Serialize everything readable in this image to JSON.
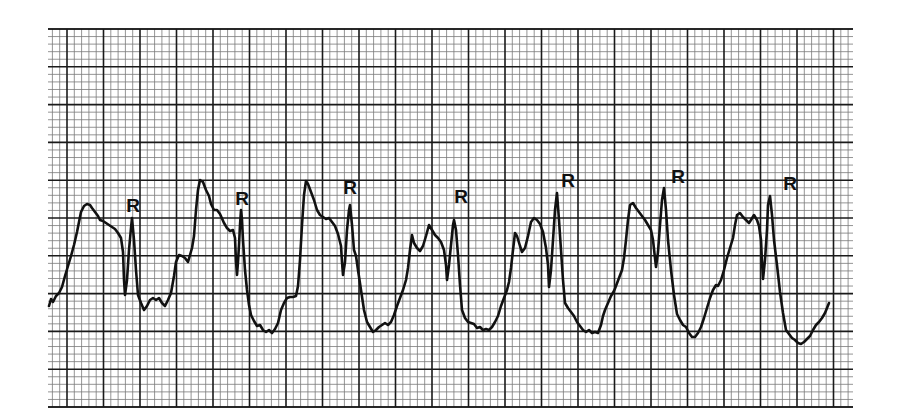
{
  "chart_data": {
    "type": "line",
    "title": "",
    "xlabel": "",
    "ylabel": "",
    "grid": {
      "on": true,
      "left": 48,
      "top": 29,
      "right": 853,
      "bottom": 407,
      "minor_spacing_x": 7.3,
      "minor_spacing_y": 7.56,
      "major_every": 5,
      "major_x_start": 67,
      "major_color": "#1a1a1a",
      "minor_color": "#7a7a7a"
    },
    "trace_color": "#111111",
    "annotations": [
      {
        "text": "R",
        "x": 133,
        "y": 212
      },
      {
        "text": "R",
        "x": 242,
        "y": 205
      },
      {
        "text": "R",
        "x": 350,
        "y": 194
      },
      {
        "text": "R",
        "x": 461,
        "y": 203
      },
      {
        "text": "R",
        "x": 568,
        "y": 187
      },
      {
        "text": "R",
        "x": 678,
        "y": 183
      },
      {
        "text": "R",
        "x": 790,
        "y": 190
      }
    ],
    "series": [
      {
        "name": "ECG trace",
        "points": [
          [
            49,
            306
          ],
          [
            51,
            299
          ],
          [
            53,
            302
          ],
          [
            56,
            296
          ],
          [
            59,
            293
          ],
          [
            62,
            287
          ],
          [
            65,
            276
          ],
          [
            68,
            266
          ],
          [
            71,
            256
          ],
          [
            74,
            245
          ],
          [
            77,
            232
          ],
          [
            79,
            222
          ],
          [
            81,
            212
          ],
          [
            84,
            206
          ],
          [
            87,
            204
          ],
          [
            90,
            205
          ],
          [
            92,
            208
          ],
          [
            95,
            212
          ],
          [
            98,
            216
          ],
          [
            100,
            220
          ],
          [
            103,
            221
          ],
          [
            106,
            223
          ],
          [
            109,
            225
          ],
          [
            112,
            227
          ],
          [
            115,
            229
          ],
          [
            118,
            233
          ],
          [
            121,
            238
          ],
          [
            123,
            252
          ],
          [
            124,
            280
          ],
          [
            125,
            295
          ],
          [
            127,
            280
          ],
          [
            129,
            250
          ],
          [
            131,
            228
          ],
          [
            132,
            218
          ],
          [
            134,
            240
          ],
          [
            136,
            270
          ],
          [
            138,
            295
          ],
          [
            141,
            303
          ],
          [
            144,
            310
          ],
          [
            147,
            306
          ],
          [
            150,
            300
          ],
          [
            153,
            298
          ],
          [
            156,
            300
          ],
          [
            159,
            298
          ],
          [
            162,
            303
          ],
          [
            165,
            306
          ],
          [
            168,
            300
          ],
          [
            171,
            293
          ],
          [
            174,
            276
          ],
          [
            176,
            262
          ],
          [
            179,
            255
          ],
          [
            182,
            256
          ],
          [
            185,
            258
          ],
          [
            188,
            262
          ],
          [
            190,
            255
          ],
          [
            192,
            248
          ],
          [
            194,
            236
          ],
          [
            196,
            210
          ],
          [
            198,
            190
          ],
          [
            200,
            180
          ],
          [
            203,
            182
          ],
          [
            206,
            190
          ],
          [
            209,
            196
          ],
          [
            211,
            204
          ],
          [
            214,
            210
          ],
          [
            217,
            210
          ],
          [
            220,
            214
          ],
          [
            224,
            223
          ],
          [
            227,
            228
          ],
          [
            230,
            231
          ],
          [
            233,
            230
          ],
          [
            235,
            238
          ],
          [
            236,
            262
          ],
          [
            237,
            275
          ],
          [
            238,
            262
          ],
          [
            239,
            245
          ],
          [
            240,
            225
          ],
          [
            241,
            210
          ],
          [
            242,
            220
          ],
          [
            243,
            240
          ],
          [
            245,
            270
          ],
          [
            247,
            290
          ],
          [
            249,
            305
          ],
          [
            251,
            315
          ],
          [
            254,
            321
          ],
          [
            257,
            326
          ],
          [
            260,
            325
          ],
          [
            263,
            330
          ],
          [
            266,
            332
          ],
          [
            269,
            330
          ],
          [
            272,
            333
          ],
          [
            275,
            329
          ],
          [
            278,
            323
          ],
          [
            281,
            310
          ],
          [
            284,
            303
          ],
          [
            287,
            298
          ],
          [
            290,
            297
          ],
          [
            293,
            297
          ],
          [
            296,
            296
          ],
          [
            298,
            286
          ],
          [
            300,
            260
          ],
          [
            302,
            225
          ],
          [
            304,
            195
          ],
          [
            306,
            181
          ],
          [
            308,
            184
          ],
          [
            311,
            192
          ],
          [
            314,
            200
          ],
          [
            317,
            210
          ],
          [
            320,
            215
          ],
          [
            323,
            217
          ],
          [
            326,
            219
          ],
          [
            329,
            218
          ],
          [
            332,
            222
          ],
          [
            335,
            226
          ],
          [
            338,
            234
          ],
          [
            341,
            246
          ],
          [
            342,
            262
          ],
          [
            343,
            275
          ],
          [
            345,
            262
          ],
          [
            347,
            230
          ],
          [
            349,
            210
          ],
          [
            350,
            205
          ],
          [
            352,
            225
          ],
          [
            354,
            250
          ],
          [
            356,
            256
          ],
          [
            358,
            270
          ],
          [
            361,
            290
          ],
          [
            364,
            310
          ],
          [
            367,
            322
          ],
          [
            370,
            327
          ],
          [
            373,
            332
          ],
          [
            376,
            330
          ],
          [
            379,
            327
          ],
          [
            382,
            325
          ],
          [
            385,
            323
          ],
          [
            388,
            325
          ],
          [
            391,
            322
          ],
          [
            394,
            315
          ],
          [
            397,
            306
          ],
          [
            400,
            298
          ],
          [
            403,
            290
          ],
          [
            406,
            280
          ],
          [
            408,
            268
          ],
          [
            410,
            250
          ],
          [
            412,
            235
          ],
          [
            414,
            243
          ],
          [
            417,
            248
          ],
          [
            420,
            251
          ],
          [
            423,
            246
          ],
          [
            426,
            236
          ],
          [
            429,
            225
          ],
          [
            432,
            230
          ],
          [
            435,
            235
          ],
          [
            438,
            238
          ],
          [
            441,
            242
          ],
          [
            444,
            250
          ],
          [
            446,
            265
          ],
          [
            447,
            280
          ],
          [
            449,
            265
          ],
          [
            451,
            245
          ],
          [
            453,
            225
          ],
          [
            454,
            220
          ],
          [
            456,
            230
          ],
          [
            458,
            255
          ],
          [
            460,
            285
          ],
          [
            462,
            310
          ],
          [
            465,
            318
          ],
          [
            468,
            322
          ],
          [
            471,
            323
          ],
          [
            474,
            324
          ],
          [
            477,
            328
          ],
          [
            480,
            327
          ],
          [
            483,
            330
          ],
          [
            486,
            329
          ],
          [
            489,
            330
          ],
          [
            492,
            327
          ],
          [
            495,
            322
          ],
          [
            498,
            316
          ],
          [
            501,
            306
          ],
          [
            504,
            298
          ],
          [
            507,
            290
          ],
          [
            509,
            282
          ],
          [
            511,
            268
          ],
          [
            513,
            250
          ],
          [
            515,
            233
          ],
          [
            517,
            236
          ],
          [
            520,
            246
          ],
          [
            522,
            252
          ],
          [
            525,
            248
          ],
          [
            528,
            236
          ],
          [
            531,
            222
          ],
          [
            534,
            218
          ],
          [
            537,
            220
          ],
          [
            540,
            224
          ],
          [
            543,
            232
          ],
          [
            546,
            248
          ],
          [
            548,
            265
          ],
          [
            549,
            287
          ],
          [
            551,
            270
          ],
          [
            553,
            240
          ],
          [
            555,
            210
          ],
          [
            557,
            193
          ],
          [
            559,
            220
          ],
          [
            561,
            250
          ],
          [
            563,
            280
          ],
          [
            565,
            303
          ],
          [
            568,
            308
          ],
          [
            571,
            312
          ],
          [
            574,
            316
          ],
          [
            577,
            322
          ],
          [
            580,
            326
          ],
          [
            583,
            330
          ],
          [
            586,
            332
          ],
          [
            589,
            330
          ],
          [
            592,
            333
          ],
          [
            595,
            332
          ],
          [
            598,
            333
          ],
          [
            601,
            325
          ],
          [
            603,
            316
          ],
          [
            605,
            310
          ],
          [
            608,
            303
          ],
          [
            611,
            296
          ],
          [
            614,
            291
          ],
          [
            616,
            286
          ],
          [
            619,
            278
          ],
          [
            622,
            270
          ],
          [
            624,
            258
          ],
          [
            626,
            240
          ],
          [
            628,
            220
          ],
          [
            630,
            205
          ],
          [
            633,
            203
          ],
          [
            636,
            208
          ],
          [
            639,
            212
          ],
          [
            642,
            216
          ],
          [
            645,
            220
          ],
          [
            648,
            225
          ],
          [
            651,
            230
          ],
          [
            653,
            240
          ],
          [
            655,
            258
          ],
          [
            656,
            267
          ],
          [
            658,
            252
          ],
          [
            660,
            225
          ],
          [
            662,
            200
          ],
          [
            664,
            188
          ],
          [
            666,
            210
          ],
          [
            668,
            240
          ],
          [
            671,
            270
          ],
          [
            674,
            295
          ],
          [
            677,
            314
          ],
          [
            680,
            320
          ],
          [
            683,
            325
          ],
          [
            686,
            327
          ],
          [
            689,
            333
          ],
          [
            692,
            337
          ],
          [
            695,
            337
          ],
          [
            698,
            333
          ],
          [
            701,
            327
          ],
          [
            704,
            318
          ],
          [
            707,
            308
          ],
          [
            710,
            298
          ],
          [
            713,
            290
          ],
          [
            716,
            285
          ],
          [
            718,
            286
          ],
          [
            721,
            280
          ],
          [
            724,
            270
          ],
          [
            727,
            258
          ],
          [
            730,
            248
          ],
          [
            733,
            238
          ],
          [
            735,
            225
          ],
          [
            737,
            215
          ],
          [
            740,
            213
          ],
          [
            743,
            217
          ],
          [
            746,
            220
          ],
          [
            749,
            223
          ],
          [
            751,
            220
          ],
          [
            754,
            215
          ],
          [
            757,
            220
          ],
          [
            759,
            226
          ],
          [
            761,
            240
          ],
          [
            762,
            262
          ],
          [
            763,
            279
          ],
          [
            765,
            260
          ],
          [
            767,
            230
          ],
          [
            768,
            205
          ],
          [
            770,
            196
          ],
          [
            772,
            215
          ],
          [
            774,
            240
          ],
          [
            777,
            265
          ],
          [
            780,
            292
          ],
          [
            783,
            313
          ],
          [
            786,
            330
          ],
          [
            789,
            334
          ],
          [
            792,
            338
          ],
          [
            795,
            340
          ],
          [
            798,
            343
          ],
          [
            801,
            344
          ],
          [
            804,
            342
          ],
          [
            807,
            339
          ],
          [
            810,
            336
          ],
          [
            813,
            330
          ],
          [
            816,
            325
          ],
          [
            819,
            322
          ],
          [
            822,
            318
          ],
          [
            825,
            313
          ],
          [
            827,
            308
          ],
          [
            829,
            303
          ]
        ]
      }
    ]
  }
}
